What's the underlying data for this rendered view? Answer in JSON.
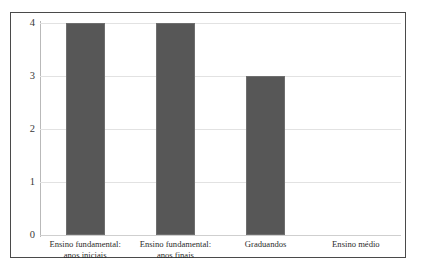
{
  "figure": {
    "title_fragment": "",
    "frame_color": "#4a4a4a",
    "background": "#ffffff"
  },
  "axis": {
    "y_ticks": [
      "0",
      "1",
      "2",
      "3",
      "4"
    ],
    "gridline_color": "#e2e2e2",
    "axis_line_color": "#b9b9b9"
  },
  "bars": {
    "fill_color": "#575757",
    "edge_color": "#6e6e6e"
  },
  "chart_data": {
    "type": "bar",
    "title": "",
    "xlabel": "",
    "ylabel": "",
    "ylim": [
      0,
      4
    ],
    "yticks": [
      0,
      1,
      2,
      3,
      4
    ],
    "grid": true,
    "legend": false,
    "orientation": "vertical",
    "categories": [
      "Ensino fundamental: anos iniciais",
      "Ensino fundamental: anos finais",
      "Graduandos",
      "Ensino médio"
    ],
    "category_lines": [
      [
        "Ensino fundamental:",
        "anos iniciais"
      ],
      [
        "Ensino fundamental:",
        "anos finais"
      ],
      [
        "Graduandos",
        ""
      ],
      [
        "Ensino médio",
        ""
      ]
    ],
    "values": [
      4,
      4,
      3,
      0
    ]
  }
}
